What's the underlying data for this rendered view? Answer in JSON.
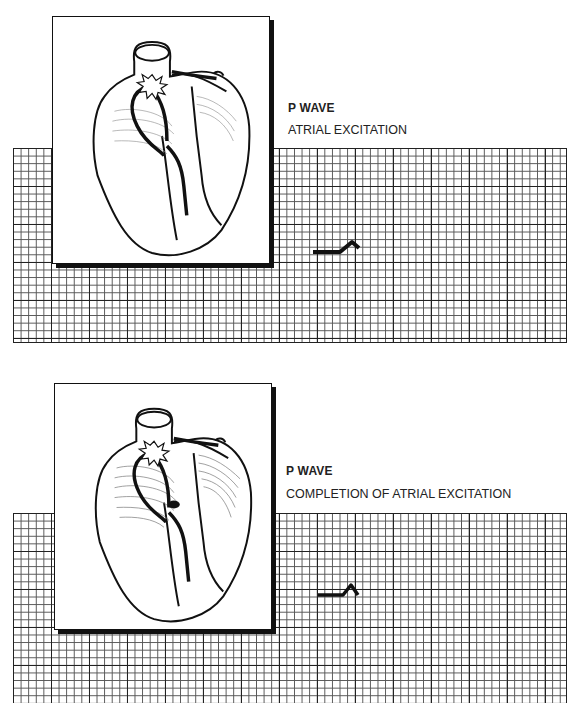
{
  "panels": [
    {
      "title": "P WAVE",
      "caption": "ATRIAL EXCITATION",
      "illustration": "heart-conduction-sa-node-firing",
      "excitation_spread": "partial"
    },
    {
      "title": "P WAVE",
      "caption": "COMPLETION OF ATRIAL EXCITATION",
      "illustration": "heart-conduction-atria-fully-excited",
      "excitation_spread": "complete"
    }
  ],
  "colors": {
    "ink": "#111111",
    "grid": "#222222",
    "paper": "#ffffff"
  }
}
